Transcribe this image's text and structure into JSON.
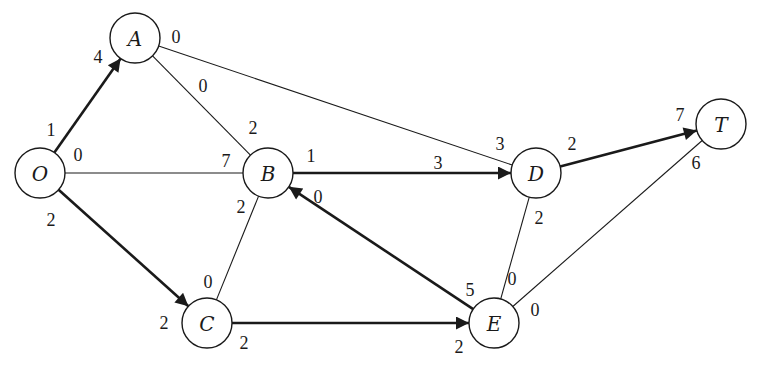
{
  "diagram": {
    "type": "flow-network",
    "nodes": [
      {
        "id": "O",
        "label": "O",
        "x": 40,
        "y": 173
      },
      {
        "id": "A",
        "label": "A",
        "x": 135,
        "y": 38
      },
      {
        "id": "B",
        "label": "B",
        "x": 268,
        "y": 173
      },
      {
        "id": "C",
        "label": "C",
        "x": 207,
        "y": 323
      },
      {
        "id": "D",
        "label": "D",
        "x": 536,
        "y": 173
      },
      {
        "id": "E",
        "label": "E",
        "x": 494,
        "y": 323
      },
      {
        "id": "T",
        "label": "T",
        "x": 721,
        "y": 124
      }
    ],
    "edges": [
      {
        "from": "O",
        "to": "A",
        "bold": true,
        "arrow": true,
        "near_from": "1",
        "near_to": "4"
      },
      {
        "from": "O",
        "to": "B",
        "bold": false,
        "arrow": false,
        "near_from": "0",
        "near_to": "7"
      },
      {
        "from": "O",
        "to": "C",
        "bold": true,
        "arrow": true,
        "near_from": "2",
        "near_to": "2"
      },
      {
        "from": "A",
        "to": "B",
        "bold": false,
        "arrow": false,
        "near_from": "0",
        "near_to": "2"
      },
      {
        "from": "A",
        "to": "D",
        "bold": false,
        "arrow": false,
        "near_from": "0",
        "near_to": "3"
      },
      {
        "from": "B",
        "to": "D",
        "bold": true,
        "arrow": true,
        "near_from": "1",
        "near_to": "3"
      },
      {
        "from": "B",
        "to": "C",
        "bold": false,
        "arrow": false,
        "near_from": "2",
        "near_to": "0"
      },
      {
        "from": "E",
        "to": "B",
        "bold": true,
        "arrow": true,
        "near_from": "5",
        "near_to": "0"
      },
      {
        "from": "C",
        "to": "E",
        "bold": true,
        "arrow": true,
        "near_from": "2",
        "near_to": "2"
      },
      {
        "from": "D",
        "to": "T",
        "bold": true,
        "arrow": true,
        "near_from": "2",
        "near_to": "7"
      },
      {
        "from": "D",
        "to": "E",
        "bold": false,
        "arrow": false,
        "near_from": "2",
        "near_to": "0"
      },
      {
        "from": "E",
        "to": "T",
        "bold": false,
        "arrow": false,
        "near_from": "0",
        "near_to": "6"
      }
    ],
    "labels": [
      {
        "text": "1",
        "x": 51,
        "y": 130
      },
      {
        "text": "4",
        "x": 98,
        "y": 57
      },
      {
        "text": "0",
        "x": 78,
        "y": 155
      },
      {
        "text": "7",
        "x": 226,
        "y": 161
      },
      {
        "text": "2",
        "x": 51,
        "y": 220
      },
      {
        "text": "2",
        "x": 164,
        "y": 323
      },
      {
        "text": "0",
        "x": 176,
        "y": 37
      },
      {
        "text": "0",
        "x": 203,
        "y": 86
      },
      {
        "text": "2",
        "x": 253,
        "y": 128
      },
      {
        "text": "3",
        "x": 500,
        "y": 144
      },
      {
        "text": "1",
        "x": 311,
        "y": 156
      },
      {
        "text": "3",
        "x": 438,
        "y": 163
      },
      {
        "text": "2",
        "x": 241,
        "y": 207
      },
      {
        "text": "0",
        "x": 208,
        "y": 282
      },
      {
        "text": "0",
        "x": 318,
        "y": 197
      },
      {
        "text": "5",
        "x": 470,
        "y": 290
      },
      {
        "text": "2",
        "x": 244,
        "y": 343
      },
      {
        "text": "2",
        "x": 459,
        "y": 347
      },
      {
        "text": "2",
        "x": 572,
        "y": 144
      },
      {
        "text": "7",
        "x": 680,
        "y": 115
      },
      {
        "text": "2",
        "x": 539,
        "y": 218
      },
      {
        "text": "0",
        "x": 512,
        "y": 279
      },
      {
        "text": "0",
        "x": 535,
        "y": 310
      },
      {
        "text": "6",
        "x": 696,
        "y": 163
      }
    ]
  }
}
